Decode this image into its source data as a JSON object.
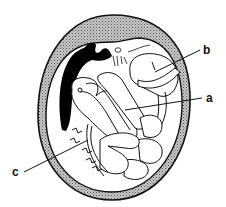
{
  "diagram": {
    "labels": [
      {
        "id": "a",
        "text": "a",
        "x": 206,
        "y": 92
      },
      {
        "id": "b",
        "text": "b",
        "x": 203,
        "y": 44
      },
      {
        "id": "c",
        "text": "c",
        "x": 12,
        "y": 166
      }
    ],
    "colors": {
      "outline": "#111111",
      "shell_fill": "#9a9a9a",
      "dark_mass": "#000000",
      "background": "#ffffff"
    }
  }
}
